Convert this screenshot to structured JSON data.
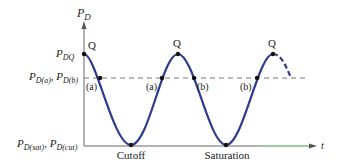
{
  "diagram": {
    "y_axis": {
      "label": "P",
      "subscript": "D"
    },
    "x_axis": {
      "label": "t"
    },
    "y_ticks": [
      {
        "main": "P",
        "sub": "DQ"
      },
      {
        "parts": [
          {
            "main": "P",
            "sub": "D(a)"
          },
          {
            "sep": ", "
          },
          {
            "main": "P",
            "sub": "D(b)"
          }
        ]
      },
      {
        "parts": [
          {
            "main": "P",
            "sub": "D(sat)"
          },
          {
            "sep": ", "
          },
          {
            "main": "P",
            "sub": "D(cut)"
          }
        ]
      }
    ],
    "peak_labels": [
      "Q",
      "Q",
      "Q"
    ],
    "crossing_labels": [
      "(a)",
      "(a)",
      "(b)",
      "(b)"
    ],
    "trough_labels": [
      "Cutoff",
      "Saturation"
    ],
    "colors": {
      "curve": "#2e3a8c",
      "axis": "#666666",
      "x_axis_tip": "#3a9a3a",
      "dashed": "#777777"
    }
  }
}
